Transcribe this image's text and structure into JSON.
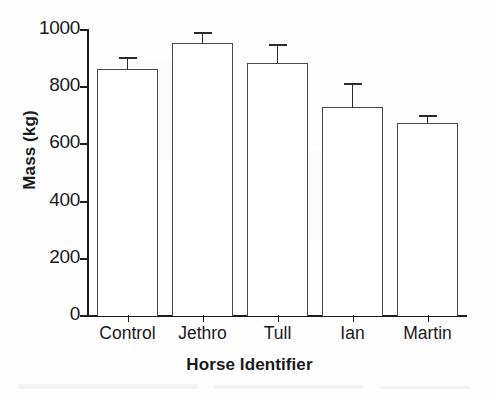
{
  "chart_data": {
    "type": "bar",
    "title": "",
    "xlabel": "Horse Identifier",
    "ylabel": "Mass (kg)",
    "categories": [
      "Control",
      "Jethro",
      "Tull",
      "Ian",
      "Martin"
    ],
    "values": [
      865,
      955,
      885,
      730,
      675
    ],
    "errors_upper": [
      40,
      38,
      65,
      85,
      28
    ],
    "error_bar_style": "upper-only-with-caps",
    "ylim": [
      0,
      1000
    ],
    "yticks": [
      0,
      200,
      400,
      600,
      800,
      1000
    ],
    "ytick_labels": [
      "0",
      "200",
      "400",
      "600",
      "800",
      "1000"
    ],
    "grid": false,
    "legend": null,
    "bar_fill_color": "#ffffff",
    "bar_edge_color": "#4a4a4a",
    "axis_color": "#1d1d1d",
    "background_color": "#fefefe"
  }
}
